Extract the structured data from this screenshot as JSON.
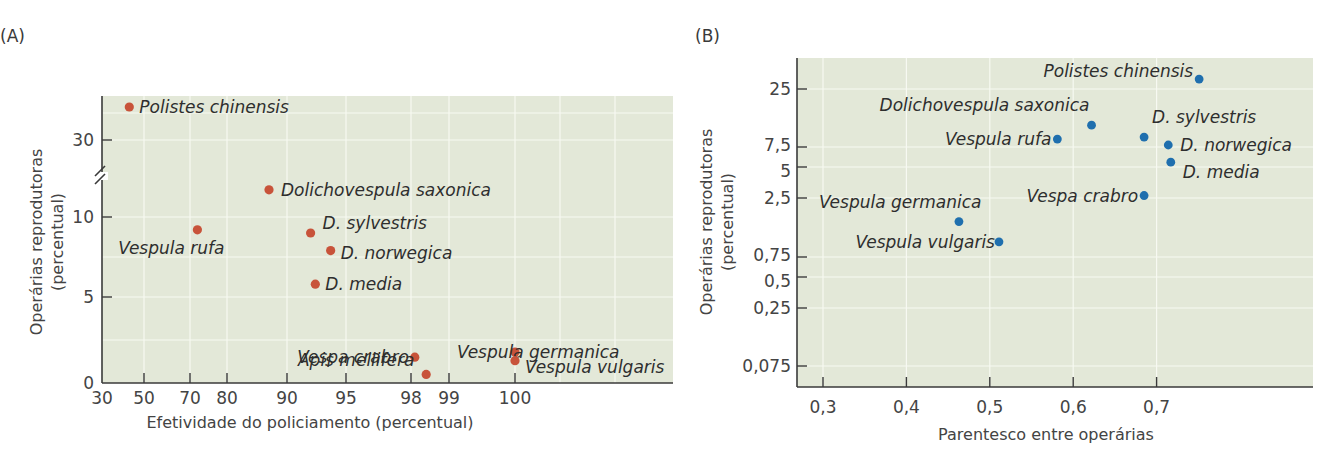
{
  "chart_data": [
    {
      "panel": "(A)",
      "type": "scatter",
      "title": "",
      "xlabel": "Efetividade do policiamento (percentual)",
      "ylabel_line1": "Operárias reprodutoras",
      "ylabel_line2": "(percentual)",
      "x_ticks": [
        "30",
        "50",
        "70",
        "80",
        "90",
        "95",
        "98",
        "99",
        "100"
      ],
      "y_ticks": [
        "0",
        "5",
        "10",
        "30"
      ],
      "y_axis_break": "between 10 and 30",
      "x_scale": "nonlinear (stretched near 100)",
      "grid": true,
      "marker_color": "#c8533a",
      "points": [
        {
          "label": "Polistes chinensis",
          "x": 43,
          "y": 35
        },
        {
          "label": "Dolichovespula saxonica",
          "x": 87,
          "y": 11.7
        },
        {
          "label": "Vespula rufa",
          "x": 72,
          "y": 9.2
        },
        {
          "label": "D. sylvestris",
          "x": 92,
          "y": 9.0
        },
        {
          "label": "D. norwegica",
          "x": 93.7,
          "y": 7.9
        },
        {
          "label": "D. media",
          "x": 92.4,
          "y": 5.8
        },
        {
          "label": "Vespa crabro",
          "x": 98.1,
          "y": 1.5
        },
        {
          "label": "Apis mellifera",
          "x": 98.4,
          "y": 0.5
        },
        {
          "label": "Vespula germanica",
          "x": 100,
          "y": 1.8
        },
        {
          "label": "Vespula vulgaris",
          "x": 100,
          "y": 1.3
        }
      ]
    },
    {
      "panel": "(B)",
      "type": "scatter",
      "title": "",
      "xlabel": "Parentesco entre operárias",
      "ylabel_line1": "Operárias reprodutoras",
      "ylabel_line2": "(percentual)",
      "x_ticks": [
        "0,3",
        "0,4",
        "0,5",
        "0,6",
        "0,7"
      ],
      "y_ticks": [
        "0,075",
        "0,25",
        "0,5",
        "0,75",
        "2,5",
        "5",
        "7,5",
        "25"
      ],
      "y_scale": "logarithmic-like",
      "xlim": [
        0.27,
        0.88
      ],
      "grid": true,
      "marker_color": "#1f6fae",
      "points": [
        {
          "label": "Polistes chinensis",
          "x": 0.751,
          "y": 28
        },
        {
          "label": "Dolichovespula saxonica",
          "x": 0.622,
          "y": 14.1
        },
        {
          "label": "Vespula rufa",
          "x": 0.581,
          "y": 9.9
        },
        {
          "label": "D. sylvestris",
          "x": 0.685,
          "y": 10.5
        },
        {
          "label": "D. norwegica",
          "x": 0.714,
          "y": 8.1
        },
        {
          "label": "D. media",
          "x": 0.717,
          "y": 5.6
        },
        {
          "label": "Vespa crabro",
          "x": 0.685,
          "y": 2.7
        },
        {
          "label": "Vespula germanica",
          "x": 0.463,
          "y": 1.8
        },
        {
          "label": "Vespula vulgaris",
          "x": 0.511,
          "y": 1.2
        }
      ]
    }
  ]
}
